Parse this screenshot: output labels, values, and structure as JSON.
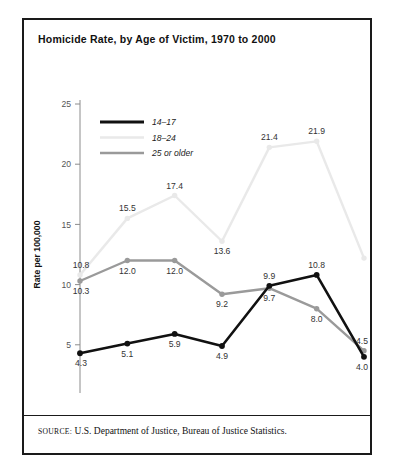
{
  "figure": {
    "title": "Homicide Rate, by Age of Victim, 1970 to 2000",
    "source_label": "SOURCE:",
    "source_text": "U.S. Department of Justice, Bureau of Justice Statistics."
  },
  "chart_data": {
    "type": "line",
    "title": "Homicide Rate, by Age of Victim, 1970 to 2000",
    "xlabel": "Year",
    "ylabel": "Rate per 100,000",
    "categories": [
      "1970",
      "1975",
      "1980",
      "1985",
      "1990",
      "1995",
      "2000"
    ],
    "x": [
      1970,
      1975,
      1980,
      1985,
      1990,
      1995,
      2000
    ],
    "xlim": [
      1970,
      2000
    ],
    "ylim": [
      0,
      25
    ],
    "yticks": [
      0,
      5,
      10,
      15,
      20,
      25
    ],
    "grid": false,
    "legend_position": "top-left",
    "series": [
      {
        "name": "14–17",
        "color": "#111111",
        "values": [
          4.3,
          5.1,
          5.9,
          4.9,
          9.9,
          10.8,
          4.0
        ],
        "labels": [
          "4.3",
          "5.1",
          "5.9",
          "4.9",
          "9.9",
          "10.8",
          "4.0"
        ],
        "label_side": [
          "below",
          "below",
          "below",
          "below",
          "above",
          "above",
          "below"
        ]
      },
      {
        "name": "18–24",
        "color": "#e9e9e9",
        "values": [
          10.8,
          15.5,
          17.4,
          13.6,
          21.4,
          21.9,
          12.2
        ],
        "labels": [
          "10.8",
          "15.5",
          "17.4",
          "13.6",
          "21.4",
          "21.9",
          "12.2"
        ],
        "label_side": [
          "above",
          "above",
          "above",
          "below",
          "above",
          "above",
          "right"
        ]
      },
      {
        "name": "25 or older",
        "color": "#9a9a9a",
        "values": [
          10.3,
          12.0,
          12.0,
          9.2,
          9.7,
          8.0,
          4.5
        ],
        "labels": [
          "10.3",
          "12.0",
          "12.0",
          "9.2",
          "9.7",
          "8.0",
          "4.5"
        ],
        "label_side": [
          "below",
          "below",
          "below",
          "below",
          "below",
          "below",
          "above"
        ]
      }
    ]
  }
}
